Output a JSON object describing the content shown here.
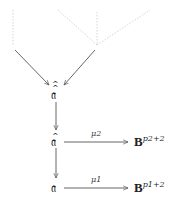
{
  "nodes": {
    "top": "𝔞",
    "middle": "𝔞",
    "bottom": "𝔞"
  },
  "accents": {
    "top": "^^",
    "middle": "^"
  },
  "edges": {
    "middle_label": "μ2",
    "bottom_label": "μ1"
  },
  "targets": {
    "middle_base": "B",
    "middle_exp": "p2+2",
    "bottom_base": "B",
    "bottom_exp": "p1+2"
  },
  "colors": {
    "arrow": "#555555",
    "dotted": "#d8d8d8",
    "text": "#222222"
  }
}
